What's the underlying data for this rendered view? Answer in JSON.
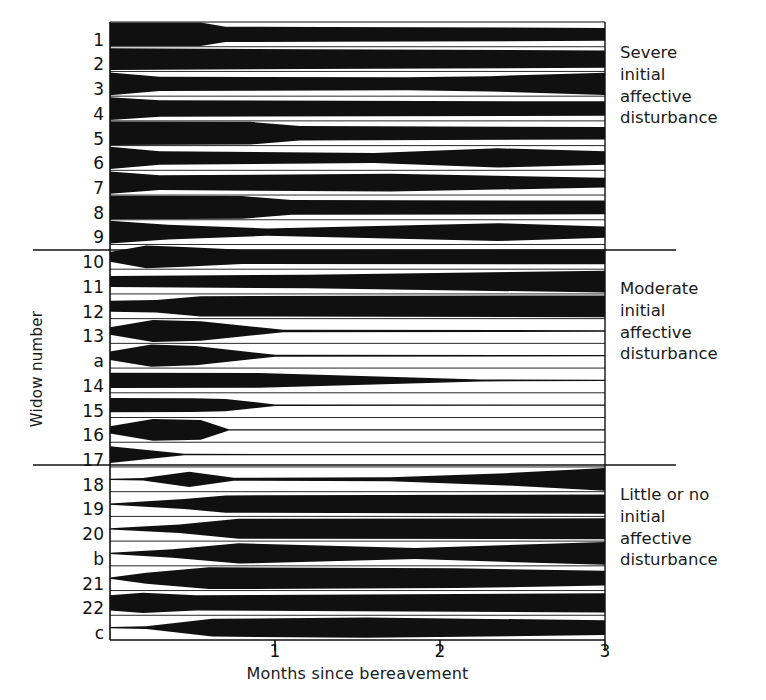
{
  "axes": {
    "x_title": "Months since bereavement",
    "y_title": "Widow number",
    "x_ticks": [
      {
        "value": 0,
        "label": ""
      },
      {
        "value": 1,
        "label": "1"
      },
      {
        "value": 2,
        "label": "2"
      },
      {
        "value": 3,
        "label": "3"
      }
    ],
    "x_range": [
      0,
      3
    ],
    "plot_left_px": 110,
    "plot_right_px": 605,
    "plot_top_px": 22,
    "plot_bottom_px": 640
  },
  "groups": [
    {
      "id": "severe",
      "note": "Severe\ninitial\naffective\ndisturbance",
      "divider_y_px": 250
    },
    {
      "id": "moderate",
      "note": "Moderate\ninitial\naffective\ndisturbance",
      "divider_y_px": 465
    },
    {
      "id": "little-or-none",
      "note": "Little or no\ninitial\naffective\ndisturbance",
      "divider_y_px": null
    }
  ],
  "chart_data": {
    "type": "area",
    "title": "",
    "xlabel": "Months since bereavement",
    "ylabel": "Widow number",
    "xlim": [
      0,
      3
    ],
    "grid": false,
    "legend_position": "right",
    "categories": [
      "1",
      "2",
      "3",
      "4",
      "5",
      "6",
      "7",
      "8",
      "9",
      "10",
      "11",
      "12",
      "13",
      "a",
      "14",
      "15",
      "16",
      "17",
      "18",
      "19",
      "20",
      "b",
      "21",
      "22",
      "c"
    ],
    "series": [
      {
        "name": "1",
        "group": "severe",
        "x": [
          0.0,
          0.55,
          0.7,
          1.3,
          3.0
        ],
        "thickness": [
          0.95,
          0.95,
          0.62,
          0.6,
          0.52
        ]
      },
      {
        "name": "2",
        "group": "severe",
        "x": [
          0.0,
          1.2,
          3.0
        ],
        "thickness": [
          0.88,
          0.8,
          0.7
        ]
      },
      {
        "name": "3",
        "group": "severe",
        "x": [
          0.0,
          0.3,
          1.8,
          2.3,
          3.0
        ],
        "thickness": [
          0.92,
          0.58,
          0.52,
          0.62,
          0.9
        ]
      },
      {
        "name": "4",
        "group": "severe",
        "x": [
          0.0,
          0.3,
          3.0
        ],
        "thickness": [
          0.92,
          0.66,
          0.58
        ]
      },
      {
        "name": "5",
        "group": "severe",
        "x": [
          0.0,
          0.85,
          1.15,
          3.0
        ],
        "thickness": [
          0.95,
          0.92,
          0.58,
          0.5
        ]
      },
      {
        "name": "6",
        "group": "severe",
        "x": [
          0.0,
          0.3,
          1.6,
          2.35,
          3.0
        ],
        "thickness": [
          0.9,
          0.55,
          0.4,
          0.78,
          0.55
        ]
      },
      {
        "name": "7",
        "group": "severe",
        "x": [
          0.0,
          0.3,
          1.7,
          3.0
        ],
        "thickness": [
          0.9,
          0.6,
          0.72,
          0.4
        ]
      },
      {
        "name": "8",
        "group": "severe",
        "x": [
          0.0,
          0.8,
          1.1,
          3.0
        ],
        "thickness": [
          0.95,
          0.92,
          0.6,
          0.55
        ]
      },
      {
        "name": "9",
        "group": "severe",
        "x": [
          0.0,
          0.35,
          0.95,
          2.35,
          3.0
        ],
        "thickness": [
          0.92,
          0.6,
          0.3,
          0.72,
          0.45
        ]
      },
      {
        "name": "10",
        "group": "moderate",
        "x": [
          0.0,
          0.22,
          0.45,
          0.8,
          3.0
        ],
        "thickness": [
          0.4,
          0.92,
          0.8,
          0.58,
          0.6
        ]
      },
      {
        "name": "11",
        "group": "moderate",
        "x": [
          0.0,
          1.2,
          3.0
        ],
        "thickness": [
          0.45,
          0.55,
          0.88
        ]
      },
      {
        "name": "12",
        "group": "moderate",
        "x": [
          0.0,
          0.28,
          0.55,
          3.0
        ],
        "thickness": [
          0.45,
          0.5,
          0.82,
          0.88
        ]
      },
      {
        "name": "13",
        "group": "moderate",
        "x": [
          0.0,
          0.26,
          0.55,
          1.05,
          3.0
        ],
        "thickness": [
          0.3,
          0.88,
          0.78,
          0.1,
          0.06
        ]
      },
      {
        "name": "a",
        "group": "moderate",
        "x": [
          0.0,
          0.25,
          0.52,
          1.0,
          3.0
        ],
        "thickness": [
          0.35,
          0.9,
          0.78,
          0.08,
          0.05
        ]
      },
      {
        "name": "14",
        "group": "moderate",
        "x": [
          0.0,
          0.9,
          2.25,
          3.0
        ],
        "thickness": [
          0.62,
          0.6,
          0.08,
          0.05
        ]
      },
      {
        "name": "15",
        "group": "moderate",
        "x": [
          0.0,
          0.5,
          0.7,
          1.0,
          3.0
        ],
        "thickness": [
          0.58,
          0.55,
          0.5,
          0.06,
          0.05
        ]
      },
      {
        "name": "16",
        "group": "moderate",
        "x": [
          0.0,
          0.26,
          0.55,
          0.72,
          3.0
        ],
        "thickness": [
          0.3,
          0.88,
          0.8,
          0.06,
          0.05
        ]
      },
      {
        "name": "17",
        "group": "moderate",
        "x": [
          0.0,
          0.45,
          3.0
        ],
        "thickness": [
          0.68,
          0.06,
          0.05
        ]
      },
      {
        "name": "18",
        "group": "little-or-none",
        "x": [
          0.0,
          0.2,
          0.48,
          0.75,
          1.7,
          2.4,
          3.0
        ],
        "thickness": [
          0.05,
          0.1,
          0.62,
          0.12,
          0.16,
          0.5,
          0.92
        ]
      },
      {
        "name": "19",
        "group": "little-or-none",
        "x": [
          0.0,
          0.45,
          0.7,
          3.0
        ],
        "thickness": [
          0.05,
          0.4,
          0.7,
          0.78
        ]
      },
      {
        "name": "20",
        "group": "little-or-none",
        "x": [
          0.0,
          0.42,
          0.78,
          3.0
        ],
        "thickness": [
          0.05,
          0.35,
          0.8,
          0.85
        ]
      },
      {
        "name": "b",
        "group": "little-or-none",
        "x": [
          0.0,
          0.38,
          0.78,
          1.85,
          3.0
        ],
        "thickness": [
          0.05,
          0.35,
          0.82,
          0.45,
          0.92
        ]
      },
      {
        "name": "21",
        "group": "little-or-none",
        "x": [
          0.0,
          0.22,
          0.6,
          2.1,
          3.0
        ],
        "thickness": [
          0.05,
          0.45,
          0.88,
          0.8,
          0.6
        ]
      },
      {
        "name": "22",
        "group": "little-or-none",
        "x": [
          0.0,
          0.2,
          0.52,
          3.0
        ],
        "thickness": [
          0.62,
          0.82,
          0.62,
          0.78
        ]
      },
      {
        "name": "c",
        "group": "little-or-none",
        "x": [
          0.0,
          0.22,
          0.62,
          1.55,
          3.0
        ],
        "thickness": [
          0.05,
          0.12,
          0.72,
          0.82,
          0.6
        ]
      }
    ]
  },
  "colors": {
    "band": "#101010",
    "axis": "#101010",
    "background": "#ffffff",
    "text": "#1a1a1a"
  }
}
